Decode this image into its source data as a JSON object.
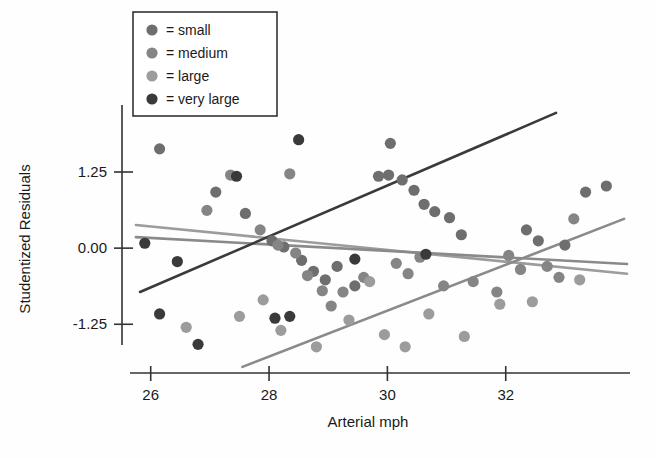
{
  "chart_data": {
    "type": "scatter",
    "title": "",
    "xlabel": "Arterial mph",
    "ylabel": "Studentized Residuals",
    "xlim": [
      25.65,
      34.1
    ],
    "ylim": [
      -2.05,
      2.35
    ],
    "xticks": [
      26,
      28,
      30,
      32
    ],
    "yticks": [
      1.25,
      0.0,
      -1.25
    ],
    "xticklabels": [
      "26",
      "28",
      "30",
      "32"
    ],
    "yticklabels": [
      "1.25",
      "0.00",
      "-1.25"
    ],
    "grid": false,
    "legend_position": "top-left",
    "legend_prefix": "=",
    "series": [
      {
        "name": "small",
        "color": "#6e6e6e",
        "points": [
          [
            26.15,
            1.63
          ],
          [
            27.1,
            0.92
          ],
          [
            27.6,
            0.57
          ],
          [
            28.05,
            0.12
          ],
          [
            28.25,
            0.02
          ],
          [
            28.55,
            -0.2
          ],
          [
            28.75,
            -0.38
          ],
          [
            28.95,
            -0.52
          ],
          [
            29.15,
            -0.3
          ],
          [
            29.45,
            -0.62
          ],
          [
            30.05,
            1.72
          ],
          [
            30.25,
            1.12
          ],
          [
            30.45,
            0.95
          ],
          [
            30.62,
            0.72
          ],
          [
            30.8,
            0.6
          ],
          [
            31.05,
            0.5
          ],
          [
            31.25,
            0.22
          ],
          [
            32.35,
            0.3
          ],
          [
            32.55,
            0.12
          ],
          [
            33.0,
            0.05
          ],
          [
            33.35,
            0.92
          ],
          [
            33.7,
            1.02
          ],
          [
            29.85,
            1.18
          ],
          [
            30.02,
            1.2
          ]
        ]
      },
      {
        "name": "medium",
        "color": "#858585",
        "points": [
          [
            26.95,
            0.62
          ],
          [
            27.35,
            1.2
          ],
          [
            27.85,
            0.3
          ],
          [
            28.15,
            0.05
          ],
          [
            28.45,
            -0.08
          ],
          [
            28.65,
            -0.45
          ],
          [
            28.9,
            -0.7
          ],
          [
            29.25,
            -0.72
          ],
          [
            29.6,
            -0.48
          ],
          [
            30.15,
            -0.25
          ],
          [
            30.35,
            -0.42
          ],
          [
            30.55,
            -0.15
          ],
          [
            30.95,
            -0.62
          ],
          [
            31.45,
            -0.55
          ],
          [
            32.05,
            -0.12
          ],
          [
            32.25,
            -0.35
          ],
          [
            32.7,
            -0.3
          ],
          [
            33.15,
            0.48
          ],
          [
            28.35,
            1.22
          ],
          [
            29.05,
            -0.95
          ],
          [
            31.85,
            -0.72
          ],
          [
            32.9,
            -0.48
          ]
        ]
      },
      {
        "name": "large",
        "color": "#9c9c9c",
        "points": [
          [
            26.6,
            -1.3
          ],
          [
            27.5,
            -1.12
          ],
          [
            28.2,
            -1.35
          ],
          [
            28.8,
            -1.62
          ],
          [
            29.35,
            -1.18
          ],
          [
            29.95,
            -1.42
          ],
          [
            30.3,
            -1.62
          ],
          [
            30.7,
            -1.08
          ],
          [
            31.3,
            -1.45
          ],
          [
            31.9,
            -0.92
          ],
          [
            32.45,
            -0.88
          ],
          [
            33.25,
            -0.52
          ],
          [
            27.9,
            -0.85
          ],
          [
            29.7,
            -0.55
          ]
        ]
      },
      {
        "name": "very large",
        "color": "#3a3a3a",
        "points": [
          [
            25.9,
            0.08
          ],
          [
            26.15,
            -1.08
          ],
          [
            26.45,
            -0.22
          ],
          [
            26.8,
            -1.58
          ],
          [
            27.45,
            1.18
          ],
          [
            28.5,
            1.78
          ],
          [
            28.1,
            -1.15
          ],
          [
            28.35,
            -1.12
          ],
          [
            29.45,
            -0.18
          ],
          [
            30.65,
            -0.1
          ]
        ]
      }
    ],
    "trend_lines": [
      {
        "name": "small",
        "color": "#9c9c9c",
        "x0": 25.75,
        "y0": 0.38,
        "x1": 34.05,
        "y1": -0.42
      },
      {
        "name": "medium",
        "color": "#8a8a8a",
        "x0": 25.75,
        "y0": 0.18,
        "x1": 34.05,
        "y1": -0.26
      },
      {
        "name": "large",
        "color": "#8a8a8a",
        "x0": 27.55,
        "y0": -1.95,
        "x1": 34.0,
        "y1": 0.48
      },
      {
        "name": "very large",
        "color": "#3a3a3a",
        "x0": 25.82,
        "y0": -0.72,
        "x1": 32.85,
        "y1": 2.22
      }
    ]
  },
  "legend": {
    "items": [
      {
        "label": "= small",
        "color": "#6e6e6e"
      },
      {
        "label": "= medium",
        "color": "#858585"
      },
      {
        "label": "= large",
        "color": "#9c9c9c"
      },
      {
        "label": "= very large",
        "color": "#3a3a3a"
      }
    ]
  }
}
